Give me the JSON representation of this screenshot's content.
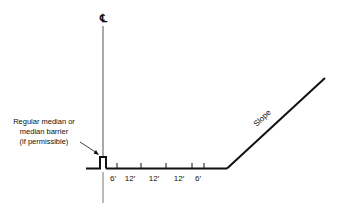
{
  "diagram": {
    "centerline_symbol": "℄",
    "median_label": [
      "Regular median or",
      "median barrier",
      "(if permissible)"
    ],
    "dimensions": [
      "6′",
      "12′",
      "12′",
      "12′",
      "6′"
    ],
    "slope_label": "Slope",
    "line_color": "#111111"
  }
}
